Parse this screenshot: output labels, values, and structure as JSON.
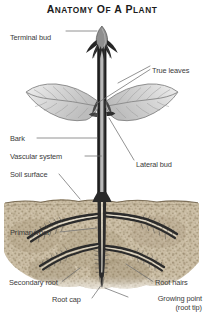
{
  "figure": {
    "title": "ANATOMY OF A PLANT",
    "title_parts": {
      "a": "A",
      "natomy": "NATOMY",
      "of": "OF",
      "a2": "A",
      "p": "P",
      "lant": "LANT"
    },
    "colors": {
      "title": "#1b1b1b",
      "label": "#3a3a3a",
      "leader_line": "#6f6f6f",
      "stem_dark": "#262626",
      "stem_core": "#a9a9a9",
      "leaf_fill": "#d8d8d8",
      "leaf_vein": "#8f8f8f",
      "soil": "#c9b99f",
      "soil_dark": "#8e7d63",
      "root": "#2b2b2b",
      "background": "#ffffff"
    },
    "labels": [
      {
        "id": "terminal-bud",
        "text": "Terminal bud",
        "side": "left",
        "x": 10,
        "y": 33,
        "align": "left"
      },
      {
        "id": "true-leaves",
        "text": "True leaves",
        "side": "right",
        "x": 152,
        "y": 67,
        "align": "left"
      },
      {
        "id": "bark",
        "text": "Bark",
        "side": "left",
        "x": 10,
        "y": 140,
        "align": "left"
      },
      {
        "id": "vascular-system",
        "text": "Vascular system",
        "side": "left",
        "x": 10,
        "y": 158,
        "align": "left"
      },
      {
        "id": "lateral-bud",
        "text": "Lateral bud",
        "side": "right",
        "x": 136,
        "y": 163,
        "align": "left"
      },
      {
        "id": "soil-surface",
        "text": "Soil surface",
        "side": "left",
        "x": 10,
        "y": 176,
        "align": "left"
      },
      {
        "id": "primary-root",
        "text": "Primary root",
        "side": "left",
        "x": 10,
        "y": 235,
        "align": "left"
      },
      {
        "id": "secondary-root",
        "text": "Secondary root",
        "side": "left",
        "x": 9,
        "y": 284,
        "align": "left"
      },
      {
        "id": "root-hairs",
        "text": "Root hairs",
        "side": "right",
        "x": 155,
        "y": 284,
        "align": "left"
      },
      {
        "id": "root-cap",
        "text": "Root cap",
        "side": "left",
        "x": 52,
        "y": 301,
        "align": "left"
      }
    ],
    "label_growing_point": {
      "id": "growing-point",
      "line1": "Growing point",
      "line2": "(root tip)",
      "x": 130,
      "y": 299
    },
    "parts": {
      "terminal_bud": "terminal-bud",
      "true_leaves": "true-leaves",
      "stem": "stem",
      "bark": "bark",
      "vascular_system": "vascular-system",
      "lateral_bud": "lateral-bud",
      "soil_surface": "soil-surface",
      "primary_root": "primary-root",
      "secondary_root": "secondary-root",
      "root_hairs": "root-hairs",
      "root_cap": "root-cap"
    }
  }
}
